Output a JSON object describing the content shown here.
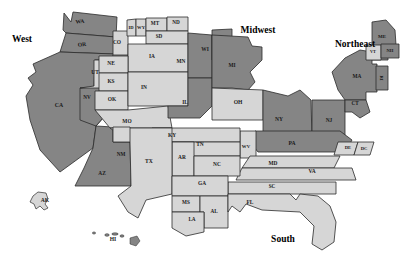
{
  "map": {
    "title": "United States Regions Cartogram",
    "colors": {
      "dark_fill": "#858585",
      "light_fill": "#d6d6d6",
      "stroke": "#2b2b2b",
      "background": "#ffffff",
      "label_color": "#1a1a1a"
    },
    "regions": [
      {
        "name": "West",
        "label": "West",
        "x": 22,
        "y": 40,
        "shade": "dark"
      },
      {
        "name": "Midwest",
        "label": "Midwest",
        "x": 258,
        "y": 31,
        "shade": "mixed"
      },
      {
        "name": "Northeast",
        "label": "Northeast",
        "x": 355,
        "y": 45,
        "shade": "dark"
      },
      {
        "name": "South",
        "label": "South",
        "x": 283,
        "y": 240,
        "shade": "light"
      }
    ],
    "states": [
      {
        "abbr": "WA",
        "x": 80,
        "y": 22,
        "shade": "dark",
        "size": 5.6,
        "rot": -7
      },
      {
        "abbr": "OR",
        "x": 82,
        "y": 45,
        "shade": "dark",
        "size": 5.6,
        "rot": -6
      },
      {
        "abbr": "CA",
        "x": 59,
        "y": 106,
        "shade": "dark",
        "size": 5.8,
        "rot": 0
      },
      {
        "abbr": "NV",
        "x": 87,
        "y": 98,
        "shade": "dark",
        "size": 5.2,
        "rot": 0
      },
      {
        "abbr": "UT",
        "x": 95,
        "y": 73,
        "shade": "light",
        "size": 5.4,
        "rot": 0
      },
      {
        "abbr": "CO",
        "x": 117,
        "y": 43,
        "shade": "light",
        "size": 5.4,
        "rot": 0
      },
      {
        "abbr": "ID",
        "x": 131,
        "y": 28,
        "shade": "light",
        "size": 4.6,
        "rot": 0
      },
      {
        "abbr": "WY",
        "x": 141,
        "y": 28,
        "shade": "light",
        "size": 4.6,
        "rot": 0
      },
      {
        "abbr": "MT",
        "x": 155,
        "y": 24,
        "shade": "light",
        "size": 5.2,
        "rot": 0
      },
      {
        "abbr": "ND",
        "x": 176,
        "y": 23,
        "shade": "light",
        "size": 5.2,
        "rot": 0
      },
      {
        "abbr": "SD",
        "x": 159,
        "y": 37,
        "shade": "light",
        "size": 5.2,
        "rot": 0
      },
      {
        "abbr": "NE",
        "x": 111,
        "y": 64,
        "shade": "light",
        "size": 5.4,
        "rot": 0
      },
      {
        "abbr": "KS",
        "x": 111,
        "y": 82,
        "shade": "light",
        "size": 5.4,
        "rot": 0
      },
      {
        "abbr": "OK",
        "x": 112,
        "y": 100,
        "shade": "light",
        "size": 5.4,
        "rot": 0
      },
      {
        "abbr": "IA",
        "x": 152,
        "y": 57,
        "shade": "light",
        "size": 5.4,
        "rot": 0
      },
      {
        "abbr": "IN",
        "x": 144,
        "y": 88,
        "shade": "light",
        "size": 5.4,
        "rot": 0
      },
      {
        "abbr": "MO",
        "x": 127,
        "y": 122,
        "shade": "light",
        "size": 5.4,
        "rot": 0
      },
      {
        "abbr": "MN",
        "x": 181,
        "y": 62,
        "shade": "dark",
        "size": 5.4,
        "rot": 0
      },
      {
        "abbr": "WI",
        "x": 205,
        "y": 50,
        "shade": "dark",
        "size": 5.4,
        "rot": 0
      },
      {
        "abbr": "IL",
        "x": 185,
        "y": 103,
        "shade": "dark",
        "size": 5.4,
        "rot": 0
      },
      {
        "abbr": "MI",
        "x": 232,
        "y": 66,
        "shade": "dark",
        "size": 5.4,
        "rot": 0
      },
      {
        "abbr": "OH",
        "x": 238,
        "y": 103,
        "shade": "light",
        "size": 5.6,
        "rot": 0
      },
      {
        "abbr": "NY",
        "x": 279,
        "y": 120,
        "shade": "dark",
        "size": 5.6,
        "rot": 0
      },
      {
        "abbr": "NJ",
        "x": 329,
        "y": 121,
        "shade": "dark",
        "size": 5.4,
        "rot": 0
      },
      {
        "abbr": "PA",
        "x": 292,
        "y": 144,
        "shade": "dark",
        "size": 5.6,
        "rot": 0
      },
      {
        "abbr": "MA",
        "x": 357,
        "y": 77,
        "shade": "dark",
        "size": 5.4,
        "rot": 0
      },
      {
        "abbr": "CT",
        "x": 355,
        "y": 104,
        "shade": "dark",
        "size": 5.2,
        "rot": 0
      },
      {
        "abbr": "ME",
        "x": 382,
        "y": 37,
        "shade": "dark",
        "size": 5.0,
        "rot": 0
      },
      {
        "abbr": "VT",
        "x": 373,
        "y": 52,
        "shade": "light",
        "size": 4.4,
        "rot": 0
      },
      {
        "abbr": "NH",
        "x": 390,
        "y": 51,
        "shade": "dark",
        "size": 4.6,
        "rot": 0
      },
      {
        "abbr": "RI",
        "x": 381,
        "y": 78,
        "shade": "dark",
        "size": 4.6,
        "rot": 90
      },
      {
        "abbr": "DE",
        "x": 348,
        "y": 148,
        "shade": "light",
        "size": 4.6,
        "rot": 0
      },
      {
        "abbr": "DC",
        "x": 364,
        "y": 149,
        "shade": "light",
        "size": 4.6,
        "rot": 0
      },
      {
        "abbr": "MD",
        "x": 273,
        "y": 164,
        "shade": "light",
        "size": 5.4,
        "rot": 0
      },
      {
        "abbr": "VA",
        "x": 312,
        "y": 172,
        "shade": "light",
        "size": 5.4,
        "rot": 0
      },
      {
        "abbr": "WV",
        "x": 246,
        "y": 147,
        "shade": "light",
        "size": 4.8,
        "rot": 0
      },
      {
        "abbr": "KY",
        "x": 172,
        "y": 136,
        "shade": "light",
        "size": 5.4,
        "rot": 0
      },
      {
        "abbr": "TN",
        "x": 200,
        "y": 145,
        "shade": "light",
        "size": 5.4,
        "rot": 0
      },
      {
        "abbr": "AR",
        "x": 182,
        "y": 158,
        "shade": "light",
        "size": 5.4,
        "rot": 0
      },
      {
        "abbr": "TX",
        "x": 149,
        "y": 162,
        "shade": "light",
        "size": 5.6,
        "rot": 0
      },
      {
        "abbr": "NM",
        "x": 121,
        "y": 155,
        "shade": "light",
        "size": 5.2,
        "rot": 0
      },
      {
        "abbr": "AZ",
        "x": 102,
        "y": 174,
        "shade": "dark",
        "size": 5.4,
        "rot": 0
      },
      {
        "abbr": "NC",
        "x": 217,
        "y": 165,
        "shade": "light",
        "size": 5.4,
        "rot": 0
      },
      {
        "abbr": "SC",
        "x": 272,
        "y": 187,
        "shade": "light",
        "size": 5.2,
        "rot": 0
      },
      {
        "abbr": "GA",
        "x": 202,
        "y": 184,
        "shade": "light",
        "size": 5.4,
        "rot": 0
      },
      {
        "abbr": "MS",
        "x": 186,
        "y": 203,
        "shade": "light",
        "size": 5.2,
        "rot": 0
      },
      {
        "abbr": "AL",
        "x": 214,
        "y": 212,
        "shade": "light",
        "size": 5.2,
        "rot": 0
      },
      {
        "abbr": "LA",
        "x": 192,
        "y": 220,
        "shade": "light",
        "size": 5.2,
        "rot": 0
      },
      {
        "abbr": "FL",
        "x": 250,
        "y": 203,
        "shade": "light",
        "size": 5.4,
        "rot": 0
      }
    ],
    "insets": [
      {
        "abbr": "AK",
        "label": "AK",
        "x": 45,
        "y": 201,
        "shade": "light"
      },
      {
        "abbr": "HI",
        "label": "HI",
        "x": 113,
        "y": 240,
        "shade": "dark"
      }
    ]
  }
}
